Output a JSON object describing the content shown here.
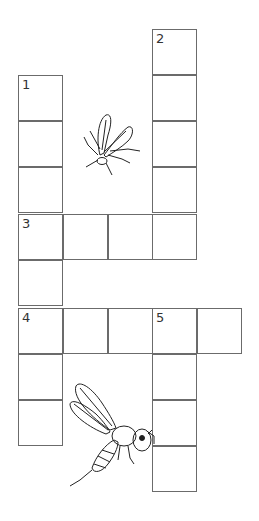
{
  "puzzle": {
    "type": "crossword",
    "cell_color": "#ffffff",
    "border_color": "#6b6b6b",
    "cells": [
      {
        "col": 0,
        "row": 1,
        "num": "1"
      },
      {
        "col": 0,
        "row": 2
      },
      {
        "col": 0,
        "row": 3
      },
      {
        "col": 0,
        "row": 4,
        "num": "3"
      },
      {
        "col": 1,
        "row": 4
      },
      {
        "col": 2,
        "row": 4
      },
      {
        "col": 3,
        "row": 4
      },
      {
        "col": 0,
        "row": 5
      },
      {
        "col": 0,
        "row": 6,
        "num": "4"
      },
      {
        "col": 1,
        "row": 6
      },
      {
        "col": 2,
        "row": 6
      },
      {
        "col": 3,
        "row": 6,
        "num": "5"
      },
      {
        "col": 4,
        "row": 6
      },
      {
        "col": 0,
        "row": 7
      },
      {
        "col": 0,
        "row": 8
      },
      {
        "col": 3,
        "row": 0,
        "num": "2"
      },
      {
        "col": 3,
        "row": 1
      },
      {
        "col": 3,
        "row": 2
      },
      {
        "col": 3,
        "row": 3
      },
      {
        "col": 3,
        "row": 7
      },
      {
        "col": 3,
        "row": 8
      },
      {
        "col": 3,
        "row": 9
      }
    ],
    "illustrations": [
      "fly-icon",
      "bee-icon"
    ]
  }
}
